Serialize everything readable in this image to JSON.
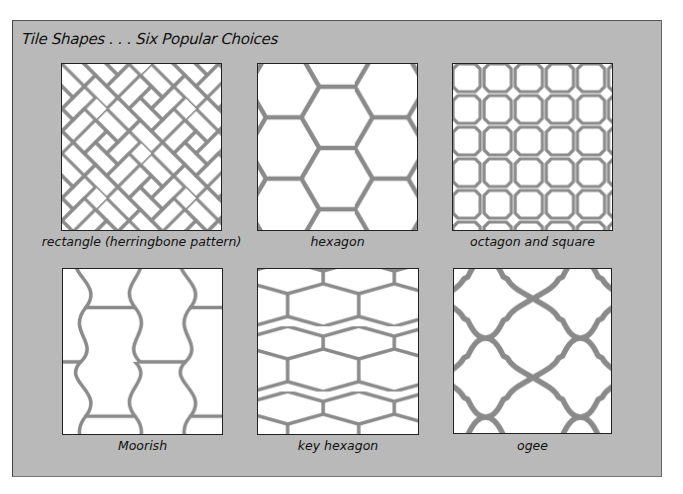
{
  "title": "Tile Shapes . . . Six Popular Choices",
  "colors": {
    "panel_background": "#b9b9b9",
    "tile_background": "#ffffff",
    "grout": "#8a8a8a",
    "grout_edge": "#555555",
    "text": "#111111"
  },
  "tiles": [
    {
      "label": "rectangle (herringbone pattern)",
      "shape": "herringbone"
    },
    {
      "label": "hexagon",
      "shape": "hexagon"
    },
    {
      "label": "octagon and square",
      "shape": "octagon-square"
    },
    {
      "label": "Moorish",
      "shape": "moorish"
    },
    {
      "label": "key hexagon",
      "shape": "key-hexagon"
    },
    {
      "label": "ogee",
      "shape": "ogee"
    }
  ]
}
